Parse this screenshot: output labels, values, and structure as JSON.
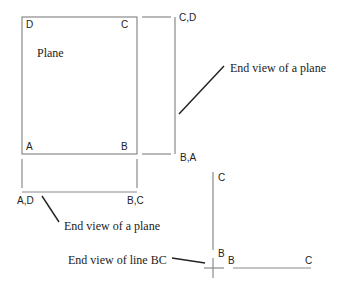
{
  "diagram": {
    "colors": {
      "background": "#ffffff",
      "line": "#8a8a8a",
      "leader": "#222222",
      "text": "#222222"
    },
    "front_view": {
      "plane_label": "Plane",
      "corners": {
        "top_left": "D",
        "top_right": "C",
        "bottom_left": "A",
        "bottom_right": "B"
      }
    },
    "side_view": {
      "top_label": "C,D",
      "bottom_label": "B,A",
      "caption": "End view of a plane"
    },
    "bottom_view": {
      "left_label": "A,D",
      "right_label": "B,C",
      "caption": "End view of a plane"
    },
    "line_view": {
      "vertical_top_label": "C",
      "vertical_bottom_label": "B",
      "horizontal_left_label": "B",
      "horizontal_right_label": "C",
      "caption": "End view of line BC"
    }
  }
}
